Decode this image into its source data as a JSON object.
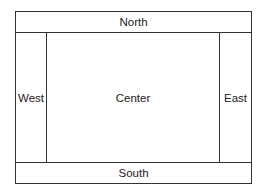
{
  "diagram": {
    "type": "border-layout",
    "regions": {
      "north": {
        "label": "North"
      },
      "south": {
        "label": "South"
      },
      "west": {
        "label": "West"
      },
      "east": {
        "label": "East"
      },
      "center": {
        "label": "Center"
      }
    },
    "colors": {
      "line": "#333333",
      "text": "#222222",
      "background": "#ffffff"
    }
  }
}
